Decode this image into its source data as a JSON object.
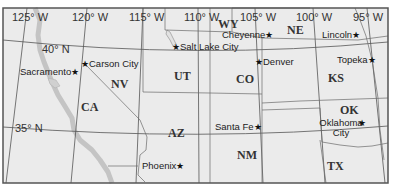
{
  "map": {
    "colors": {
      "land": "#ebebeb",
      "water": "#c9c9c9",
      "frame": "#555555",
      "grid": "#555555",
      "border": "#666666"
    },
    "longitude_labels": [
      {
        "label": "125° W"
      },
      {
        "label": "120° W"
      },
      {
        "label": "115° W"
      },
      {
        "label": "110° W"
      },
      {
        "label": "105° W"
      },
      {
        "label": "100° W"
      },
      {
        "label": "95° W"
      }
    ],
    "latitude_labels": [
      {
        "label": "40° N"
      },
      {
        "label": "35° N"
      }
    ],
    "states": [
      {
        "abbr": "WY"
      },
      {
        "abbr": "NE"
      },
      {
        "abbr": "NV"
      },
      {
        "abbr": "UT"
      },
      {
        "abbr": "CO"
      },
      {
        "abbr": "KS"
      },
      {
        "abbr": "CA"
      },
      {
        "abbr": "OK"
      },
      {
        "abbr": "AZ"
      },
      {
        "abbr": "NM"
      },
      {
        "abbr": "TX"
      }
    ],
    "cities": [
      {
        "name": "Cheyenne"
      },
      {
        "name": "Lincoln"
      },
      {
        "name": "Salt Lake City"
      },
      {
        "name": "Carson City"
      },
      {
        "name": "Sacramento"
      },
      {
        "name": "Denver"
      },
      {
        "name": "Topeka"
      },
      {
        "name": "Oklahoma City"
      },
      {
        "name": "Santa Fe"
      },
      {
        "name": "Phoenix"
      }
    ],
    "capital_symbol": "★"
  }
}
